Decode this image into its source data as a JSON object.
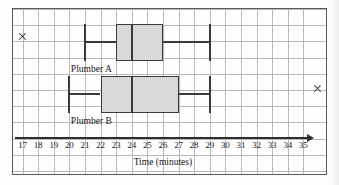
{
  "figure": {
    "kind": "box-and-whisker-plot",
    "background": "#fefefe",
    "grid_color": "#b9b9bd",
    "ink_color": "#3a3a3e",
    "box_fill": "#d9d9d9"
  },
  "axis": {
    "title": "Time (minutes)",
    "unit": "minutes",
    "min": 17,
    "max": 35,
    "step": 1,
    "ticks": [
      "17",
      "18",
      "19",
      "20",
      "21",
      "22",
      "23",
      "24",
      "25",
      "26",
      "27",
      "28",
      "29",
      "30",
      "31",
      "32",
      "33",
      "34",
      "35"
    ],
    "arrow": "axis-arrow-right"
  },
  "artifacts": [
    {
      "name": "x-mark-left",
      "glyph": "×"
    },
    {
      "name": "x-mark-right",
      "glyph": "×"
    }
  ],
  "chart_data": {
    "type": "box",
    "title": "",
    "xlabel": "Time (minutes)",
    "ylabel": "",
    "xlim": [
      17,
      35
    ],
    "grid": true,
    "legend": "none",
    "orientation": "horizontal",
    "categories": [
      "Plumber A",
      "Plumber B"
    ],
    "series": [
      {
        "name": "Plumber A",
        "min": 21,
        "q1": 23,
        "median": 24,
        "q3": 26,
        "max": 29,
        "iqr": 3,
        "range": 8
      },
      {
        "name": "Plumber B",
        "min": 20,
        "q1": 22,
        "median": 24,
        "q3": 27,
        "max": 29,
        "iqr": 5,
        "range": 9
      }
    ]
  }
}
